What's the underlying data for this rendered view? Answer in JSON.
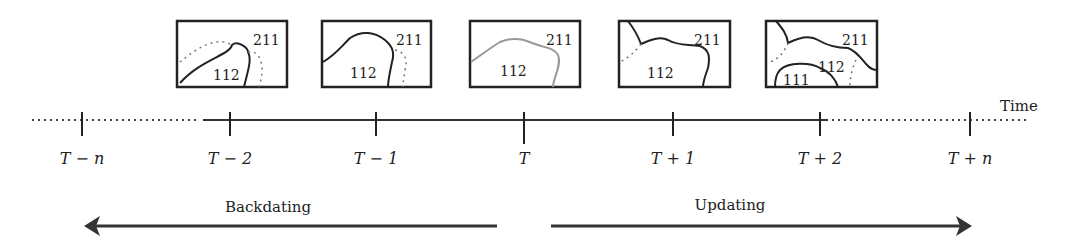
{
  "diagram": {
    "axis_label": "Time",
    "ticks": [
      {
        "id": "t-minus-n",
        "label": "T − n",
        "x": 82
      },
      {
        "id": "t-minus-2",
        "label": "T − 2",
        "x": 230
      },
      {
        "id": "t-minus-1",
        "label": "T − 1",
        "x": 376
      },
      {
        "id": "t",
        "label": "T",
        "x": 524
      },
      {
        "id": "t-plus-1",
        "label": "T + 1",
        "x": 673
      },
      {
        "id": "t-plus-2",
        "label": "T + 2",
        "x": 820
      },
      {
        "id": "t-plus-n",
        "label": "T + n",
        "x": 970
      }
    ],
    "maps": [
      {
        "time": "T-2",
        "regions": [
          "211",
          "112"
        ]
      },
      {
        "time": "T-1",
        "regions": [
          "211",
          "112"
        ]
      },
      {
        "time": "T",
        "regions": [
          "211",
          "112"
        ]
      },
      {
        "time": "T+1",
        "regions": [
          "211",
          "112"
        ]
      },
      {
        "time": "T+2",
        "regions": [
          "211",
          "112",
          "111"
        ]
      }
    ],
    "arrows": {
      "left": "Backdating",
      "right": "Updating"
    },
    "colors": {
      "ink": "#222222",
      "current_boundary": "#9a9a9a",
      "dotted": "#777777"
    }
  }
}
